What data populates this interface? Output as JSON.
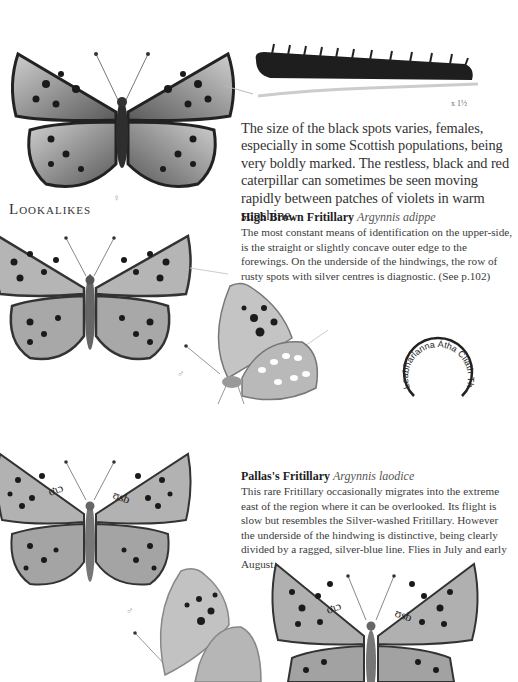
{
  "page": {
    "main_text": "The size of the black spots varies, females, especially in some Scottish populations, being very boldly marked. The restless, black and red caterpillar can sometimes be seen moving rapidly between patches of violets in warm sunshine.",
    "section_heading": "Lookalikes",
    "caterpillar_scale": "x 1½",
    "figures": {
      "top_butterfly_sex": "♀",
      "lookalike1_underside_sex": "♂",
      "lookalike2_underside_sex": "♂"
    },
    "entries": [
      {
        "common_name": "High Brown Fritillary",
        "latin_name": "Argynnis adippe",
        "description": "The most constant means of identification on the upper-side, is the straight or slightly concave outer edge to the forewings. On the underside of the hindwings, the row of rusty spots with silver centres is diagnostic. (See p.102)"
      },
      {
        "common_name": "Pallas's Fritillary",
        "latin_name": "Argynnis laodice",
        "description": "This rare Fritillary occasionally migrates into the extreme east of the region where it can be overlooked. Its flight is slow but resembles the Silver-washed Fritillary. However the underside of the hindwing is distinctive, being clearly divided by a ragged, silver-blue line. Flies in July and early August."
      }
    ],
    "library_stamp": {
      "text": "Leabharlanna Átha Cliath Theas"
    }
  },
  "colors": {
    "background": "#ffffff",
    "text": "#333333",
    "wing_light": "#bdbdbd",
    "wing_dark": "#2b2b2b"
  }
}
